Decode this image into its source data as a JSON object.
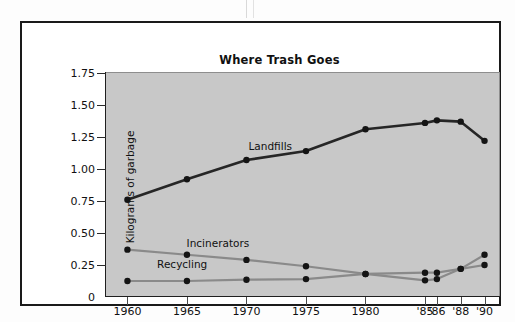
{
  "figure": {
    "title": "Where Trash Goes"
  },
  "chart_data": {
    "type": "line",
    "title": "Where Trash Goes",
    "xlabel": "",
    "ylabel": "Kilograms of garbage",
    "grid": false,
    "legend_position": "inline-labels",
    "x_tick_labels": [
      "1960",
      "1965",
      "1970",
      "1975",
      "1980",
      "'85",
      "'86",
      "'88",
      "'90"
    ],
    "x": [
      1960,
      1965,
      1970,
      1975,
      1980,
      1985,
      1986,
      1988,
      1990
    ],
    "xlim": [
      1958.2,
      1991.3
    ],
    "y_tick_labels": [
      "1.75",
      "1.50",
      "1.25",
      "1.00",
      "0.75",
      "0.50",
      "0.25",
      "0"
    ],
    "y_ticks": [
      1.75,
      1.5,
      1.25,
      1.0,
      0.75,
      0.5,
      0.25,
      0
    ],
    "ylim": [
      0,
      1.75
    ],
    "series": [
      {
        "name": "Landfills",
        "color": "#262626",
        "values": [
          0.76,
          0.92,
          1.07,
          1.14,
          1.31,
          1.36,
          1.38,
          1.37,
          1.22
        ]
      },
      {
        "name": "Incinerators",
        "color": "#8a8a8a",
        "values": [
          0.37,
          0.33,
          0.29,
          0.24,
          0.18,
          0.13,
          0.14,
          0.22,
          0.25
        ]
      },
      {
        "name": "Recycling",
        "color": "#8a8a8a",
        "values": [
          0.125,
          0.125,
          0.135,
          0.14,
          0.18,
          0.19,
          0.19,
          0.22,
          0.33
        ]
      }
    ],
    "inline_labels": [
      {
        "text": "Landfills",
        "x": 1972.0,
        "y": 1.18
      },
      {
        "text": "Incinerators",
        "x": 1967.6,
        "y": 0.42
      },
      {
        "text": "Recycling",
        "x": 1964.6,
        "y": 0.255
      }
    ]
  }
}
